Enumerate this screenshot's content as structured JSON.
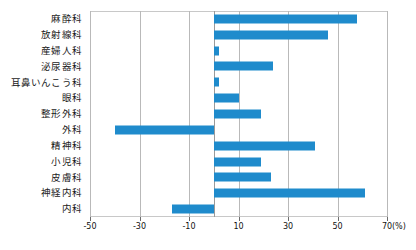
{
  "chart_data": {
    "type": "bar",
    "orientation": "horizontal",
    "title": "",
    "xlabel": "(%)",
    "ylabel": "",
    "xlim": [
      -50,
      70
    ],
    "ylim": null,
    "grid": true,
    "legend": null,
    "bar_color": "#1f8bcc",
    "xticks": [
      -50,
      -30,
      -10,
      10,
      30,
      50,
      70
    ],
    "xtick_labels": [
      "-50",
      "-30",
      "-10",
      "10",
      "30",
      "50",
      "70"
    ],
    "unit_label": "(%)",
    "categories": [
      "麻酔科",
      "放射線科",
      "産婦人科",
      "泌尿器科",
      "耳鼻いんこう科",
      "眼科",
      "整形外科",
      "外科",
      "精神科",
      "小児科",
      "皮膚科",
      "神経内科",
      "内科"
    ],
    "values": [
      58,
      46,
      2,
      24,
      2,
      10,
      19,
      -40,
      41,
      19,
      23,
      61,
      -17
    ]
  }
}
